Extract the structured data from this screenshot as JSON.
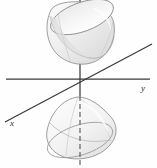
{
  "figure": {
    "background_color": "#fefefe",
    "width": 157,
    "height": 168,
    "axis_color": "#3a3a3a",
    "surface_stroke_color": "#8d8d8d",
    "surface_fill_light": "#f4f4f4",
    "surface_fill_mid": "#e4e4e4",
    "surface_fill_shadow": "#cfcfcf"
  },
  "axes": [
    {
      "id": "x-axis",
      "label": "x",
      "label_x": 12,
      "label_y": 126,
      "x1": 5,
      "y1": 122,
      "x2": 152,
      "y2": 44,
      "orientation": "diagonal-depth"
    },
    {
      "id": "y-axis",
      "label": "y",
      "label_x": 143,
      "label_y": 91,
      "x1": 6,
      "y1": 79,
      "x2": 150,
      "y2": 79,
      "orientation": "horizontal"
    },
    {
      "id": "z-axis",
      "label": "",
      "label_x": 0,
      "label_y": 0,
      "x1": 80,
      "y1": 0,
      "x2": 80,
      "y2": 168,
      "orientation": "vertical"
    }
  ],
  "origin": {
    "x": 80,
    "y": 79
  },
  "surfaces": [
    {
      "id": "upper-nappe",
      "name": "upper-sheet",
      "description": "Bowl opening upward above the origin",
      "rim_center_x": 80,
      "rim_center_y": 13,
      "rim_rx": 34,
      "rim_ry": 15,
      "rim_rotation_deg": -18,
      "vertex_x": 71,
      "vertex_y": 64,
      "bounds": {
        "left": 45,
        "top": 0,
        "right": 115,
        "bottom": 66
      }
    },
    {
      "id": "lower-nappe",
      "name": "lower-sheet",
      "description": "Dome opening downward below the origin",
      "rim_center_x": 80,
      "rim_center_y": 146,
      "rim_rx": 34,
      "rim_ry": 15,
      "rim_rotation_deg": -18,
      "vertex_x": 78,
      "vertex_y": 97,
      "bounds": {
        "left": 46,
        "top": 96,
        "right": 116,
        "bottom": 160
      }
    }
  ]
}
